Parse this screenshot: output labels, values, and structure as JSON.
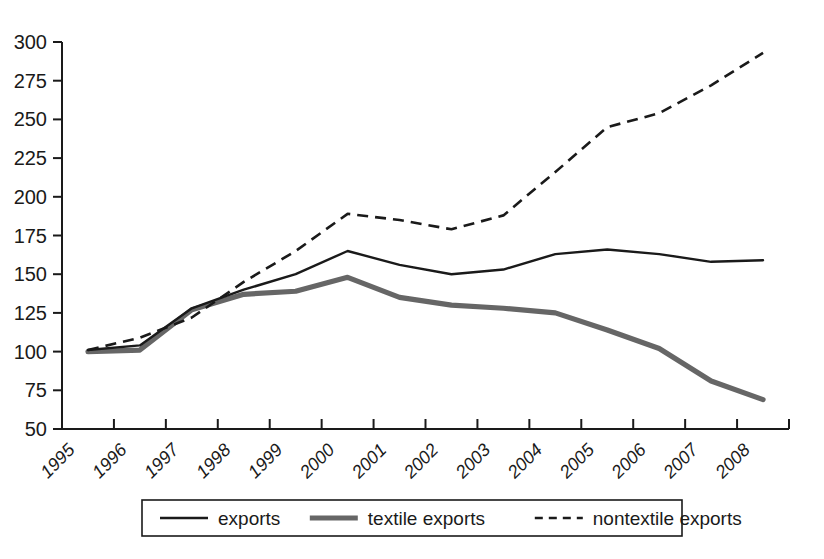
{
  "chart_data": {
    "type": "line",
    "title": "",
    "subtitle": "",
    "xlabel": "",
    "ylabel": "",
    "x": [
      "1995",
      "1996",
      "1997",
      "1998",
      "1999",
      "2000",
      "2001",
      "2002",
      "2003",
      "2004",
      "2005",
      "2006",
      "2007",
      "2008"
    ],
    "categories": [
      "1995",
      "1996",
      "1997",
      "1998",
      "1999",
      "2000",
      "2001",
      "2002",
      "2003",
      "2004",
      "2005",
      "2006",
      "2007",
      "2008"
    ],
    "xtick_labels": [
      "1995",
      "1996",
      "1997",
      "1998",
      "1999",
      "2000",
      "2001",
      "2002",
      "2003",
      "2004",
      "2005",
      "2006",
      "2007",
      "2008"
    ],
    "ytick_labels": [
      "50",
      "75",
      "100",
      "125",
      "150",
      "175",
      "200",
      "225",
      "250",
      "275",
      "300"
    ],
    "yticks": [
      50,
      75,
      100,
      125,
      150,
      175,
      200,
      225,
      250,
      275,
      300
    ],
    "ylim": [
      50,
      300
    ],
    "grid": false,
    "legend_position": "bottom",
    "series": [
      {
        "name": "exports",
        "style": "solid-thin",
        "color": "#1a1a1a",
        "values": [
          101,
          104,
          128,
          140,
          150,
          165,
          156,
          150,
          153,
          163,
          166,
          163,
          158,
          159
        ]
      },
      {
        "name": "textile exports",
        "style": "solid-thick-gray",
        "color": "#666666",
        "values": [
          100,
          101,
          127,
          137,
          139,
          148,
          135,
          130,
          128,
          125,
          114,
          102,
          81,
          69
        ]
      },
      {
        "name": "nontextile exports",
        "style": "dashed",
        "color": "#1a1a1a",
        "values": [
          101,
          109,
          122,
          145,
          165,
          189,
          185,
          179,
          188,
          216,
          245,
          254,
          272,
          293
        ]
      }
    ],
    "legend": [
      {
        "label": "exports",
        "swatch": "solid-thin"
      },
      {
        "label": "textile exports",
        "swatch": "solid-thick-gray"
      },
      {
        "label": "nontextile exports",
        "swatch": "dashed"
      }
    ]
  }
}
